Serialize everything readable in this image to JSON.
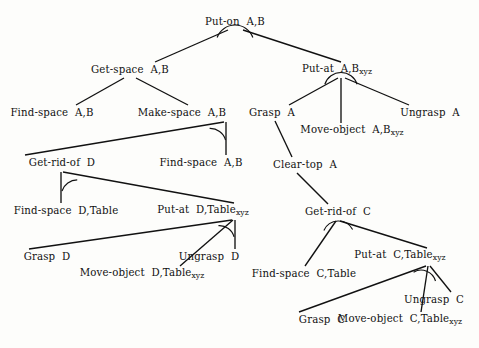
{
  "figure": {
    "name": "and-or-task-decomposition-tree",
    "type": "tree-diagram",
    "width": 479,
    "height": 348,
    "background_color": "#fdfdfb",
    "line_color": "#111111",
    "text_color": "#111111",
    "arc_meaning": "arc across sibling edges denotes an AND-decomposition of the parent task"
  },
  "nodes": [
    {
      "id": "put-on-ab",
      "base": "Put-on",
      "args": "A,B",
      "subscript": "",
      "x": 235,
      "y": 22,
      "arc": {
        "cx": 235,
        "cy": 31,
        "r": 19,
        "start_deg": 200,
        "end_deg": 340
      }
    },
    {
      "id": "get-space-ab",
      "base": "Get-space",
      "args": "A,B",
      "subscript": "",
      "x": 130,
      "y": 70,
      "arc": null
    },
    {
      "id": "put-at-ab-xyz",
      "base": "Put-at",
      "args": "A,B",
      "subscript": "xyz",
      "x": 337,
      "y": 70,
      "arc": {
        "cx": 341,
        "cy": 79,
        "r": 17,
        "start_deg": 198,
        "end_deg": 342
      }
    },
    {
      "id": "find-space-ab-left",
      "base": "Find-space",
      "args": "A,B",
      "subscript": "",
      "x": 52,
      "y": 113,
      "arc": null
    },
    {
      "id": "make-space-ab",
      "base": "Make-space",
      "args": "A,B",
      "subscript": "",
      "x": 182,
      "y": 113,
      "arc": {
        "cx": 225,
        "cy": 124,
        "r": 16,
        "start_deg": 196,
        "end_deg": 272
      }
    },
    {
      "id": "grasp-a",
      "base": "Grasp",
      "args": "A",
      "subscript": "",
      "x": 272,
      "y": 113,
      "arc": null
    },
    {
      "id": "move-object-ab-xyz",
      "base": "Move-object",
      "args": "A,B",
      "subscript": "xyz",
      "x": 352,
      "y": 131,
      "arc": null
    },
    {
      "id": "ungrasp-a",
      "base": "Ungrasp",
      "args": "A",
      "subscript": "",
      "x": 430,
      "y": 113,
      "arc": null
    },
    {
      "id": "get-rid-of-d",
      "base": "Get-rid-of",
      "args": "D",
      "subscript": "",
      "x": 62,
      "y": 163,
      "arc": {
        "cx": 62,
        "cy": 175,
        "r": 16,
        "start_deg": 270,
        "end_deg": 342
      }
    },
    {
      "id": "find-space-ab-right",
      "base": "Find-space",
      "args": "A,B",
      "subscript": "",
      "x": 201,
      "y": 163,
      "arc": null
    },
    {
      "id": "clear-top-a",
      "base": "Clear-top",
      "args": "A",
      "subscript": "",
      "x": 305,
      "y": 165,
      "arc": null
    },
    {
      "id": "find-space-d-table",
      "base": "Find-space",
      "args": "D,Table",
      "subscript": "",
      "x": 66,
      "y": 211,
      "arc": null
    },
    {
      "id": "put-at-d-table-xyz",
      "base": "Put-at",
      "args": "D,Table",
      "subscript": "xyz",
      "x": 203,
      "y": 211,
      "arc": {
        "cx": 233,
        "cy": 222,
        "r": 15,
        "start_deg": 194,
        "end_deg": 274
      }
    },
    {
      "id": "get-rid-of-c",
      "base": "Get-rid-of",
      "args": "C",
      "subscript": "",
      "x": 338,
      "y": 212,
      "arc": {
        "cx": 338,
        "cy": 223,
        "r": 16,
        "start_deg": 208,
        "end_deg": 336
      }
    },
    {
      "id": "grasp-d",
      "base": "Grasp",
      "args": "D",
      "subscript": "",
      "x": 47,
      "y": 257,
      "arc": null
    },
    {
      "id": "move-object-d-table-xyz",
      "base": "Move-object",
      "args": "D,Table",
      "subscript": "xyz",
      "x": 142,
      "y": 274,
      "arc": null
    },
    {
      "id": "ungrasp-d",
      "base": "Ungrasp",
      "args": "D",
      "subscript": "",
      "x": 209,
      "y": 257,
      "arc": null
    },
    {
      "id": "find-space-c-table",
      "base": "Find-space",
      "args": "C,Table",
      "subscript": "",
      "x": 304,
      "y": 274,
      "arc": null
    },
    {
      "id": "put-at-c-table-xyz",
      "base": "Put-at",
      "args": "C,Table",
      "subscript": "xyz",
      "x": 400,
      "y": 256,
      "arc": {
        "cx": 428,
        "cy": 268,
        "r": 15,
        "start_deg": 196,
        "end_deg": 300
      }
    },
    {
      "id": "grasp-c",
      "base": "Grasp",
      "args": "C",
      "subscript": "",
      "x": 322,
      "y": 320,
      "arc": null
    },
    {
      "id": "move-object-c-table-xyz",
      "base": "Move-object",
      "args": "C,Table",
      "subscript": "xyz",
      "x": 400,
      "y": 320,
      "arc": null
    },
    {
      "id": "ungrasp-c",
      "base": "Ungrasp",
      "args": "C",
      "subscript": "",
      "x": 434,
      "y": 300,
      "arc": null
    }
  ],
  "edges": [
    {
      "from": "put-on-ab",
      "to": "get-space-ab",
      "x1": 228,
      "y1": 30,
      "x2": 155,
      "y2": 62
    },
    {
      "from": "put-on-ab",
      "to": "put-at-ab-xyz",
      "x1": 243,
      "y1": 30,
      "x2": 341,
      "y2": 62
    },
    {
      "from": "get-space-ab",
      "to": "find-space-ab-left",
      "x1": 124,
      "y1": 78,
      "x2": 76,
      "y2": 105
    },
    {
      "from": "get-space-ab",
      "to": "make-space-ab",
      "x1": 136,
      "y1": 78,
      "x2": 188,
      "y2": 105
    },
    {
      "from": "put-at-ab-xyz",
      "to": "grasp-a",
      "x1": 338,
      "y1": 78,
      "x2": 289,
      "y2": 105
    },
    {
      "from": "put-at-ab-xyz",
      "to": "move-object-ab-xyz",
      "x1": 341,
      "y1": 78,
      "x2": 341,
      "y2": 123
    },
    {
      "from": "put-at-ab-xyz",
      "to": "ungrasp-a",
      "x1": 345,
      "y1": 78,
      "x2": 409,
      "y2": 105
    },
    {
      "from": "make-space-ab",
      "to": "get-rid-of-d",
      "x1": 224,
      "y1": 122,
      "x2": 25,
      "y2": 155
    },
    {
      "from": "make-space-ab",
      "to": "find-space-ab-right",
      "x1": 226,
      "y1": 122,
      "x2": 226,
      "y2": 155
    },
    {
      "from": "grasp-a",
      "to": "clear-top-a",
      "x1": 275,
      "y1": 121,
      "x2": 292,
      "y2": 157
    },
    {
      "from": "get-rid-of-d",
      "to": "find-space-d-table",
      "x1": 61,
      "y1": 172,
      "x2": 61,
      "y2": 203
    },
    {
      "from": "get-rid-of-d",
      "to": "put-at-d-table-xyz",
      "x1": 63,
      "y1": 172,
      "x2": 234,
      "y2": 203
    },
    {
      "from": "clear-top-a",
      "to": "get-rid-of-c",
      "x1": 297,
      "y1": 173,
      "x2": 328,
      "y2": 204
    },
    {
      "from": "put-at-d-table-xyz",
      "to": "grasp-d",
      "x1": 232,
      "y1": 220,
      "x2": 29,
      "y2": 249
    },
    {
      "from": "put-at-d-table-xyz",
      "to": "move-object-d-table-xyz",
      "x1": 233,
      "y1": 220,
      "x2": 180,
      "y2": 266
    },
    {
      "from": "put-at-d-table-xyz",
      "to": "ungrasp-d",
      "x1": 235,
      "y1": 220,
      "x2": 235,
      "y2": 249
    },
    {
      "from": "get-rid-of-c",
      "to": "find-space-c-table",
      "x1": 336,
      "y1": 221,
      "x2": 305,
      "y2": 266
    },
    {
      "from": "get-rid-of-c",
      "to": "put-at-c-table-xyz",
      "x1": 340,
      "y1": 221,
      "x2": 427,
      "y2": 248
    },
    {
      "from": "put-at-c-table-xyz",
      "to": "grasp-c",
      "x1": 426,
      "y1": 266,
      "x2": 299,
      "y2": 312
    },
    {
      "from": "put-at-c-table-xyz",
      "to": "move-object-c-table-xyz",
      "x1": 428,
      "y1": 266,
      "x2": 421,
      "y2": 312
    },
    {
      "from": "put-at-c-table-xyz",
      "to": "ungrasp-c",
      "x1": 430,
      "y1": 266,
      "x2": 451,
      "y2": 292
    }
  ]
}
